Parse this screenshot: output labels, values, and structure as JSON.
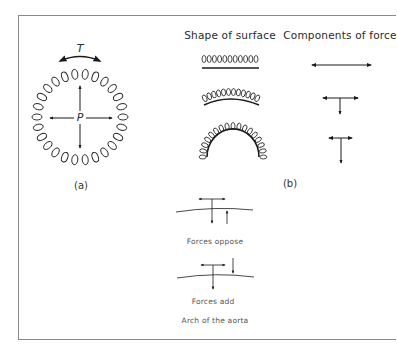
{
  "figure": {
    "frame_color": "#8a8a8a",
    "ink_color": "#1a1a1a",
    "panel_a": {
      "label": "(a)",
      "tension_symbol": "T",
      "pressure_symbol": "P",
      "description": "Coiled spring circle with pressure arrows pointing outward and tension arc arrow on top"
    },
    "panel_b": {
      "label": "(b)",
      "column_headers": {
        "shape": "Shape of surface",
        "components": "Components of force"
      },
      "rows": [
        {
          "shape": "flat",
          "components": "horizontal only"
        },
        {
          "shape": "slight curve",
          "components": "horizontal with small downward component"
        },
        {
          "shape": "semicircle",
          "components": "short horizontal with larger downward component"
        }
      ]
    },
    "aorta": {
      "forces_oppose_label": "Forces oppose",
      "forces_add_label": "Forces add",
      "caption": "Arch of the aorta"
    }
  }
}
